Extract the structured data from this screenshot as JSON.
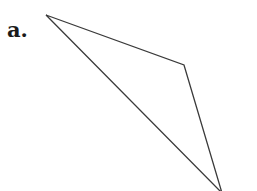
{
  "figure": {
    "label": "a.",
    "shape": "triangle",
    "stroke_color": "#3a3a3a",
    "vertices": [
      {
        "x": 46,
        "y": 15
      },
      {
        "x": 184,
        "y": 65
      },
      {
        "x": 222,
        "y": 193
      }
    ]
  }
}
